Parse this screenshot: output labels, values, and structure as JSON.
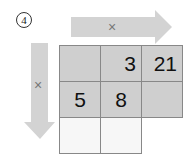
{
  "problem": {
    "number_label": "4"
  },
  "arrows": {
    "horizontal": {
      "operator": "×",
      "color": "#d3d3d3"
    },
    "vertical": {
      "operator": "×",
      "color": "#d3d3d3"
    }
  },
  "grid": {
    "rows": [
      [
        "",
        "3",
        "21"
      ],
      [
        "5",
        "8",
        ""
      ],
      [
        "",
        "",
        null
      ]
    ],
    "shaded_color": "#cfcfcf",
    "blank_color": "#f7f7f7"
  }
}
